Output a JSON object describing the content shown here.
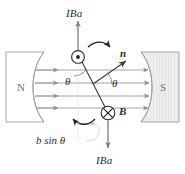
{
  "figure": {
    "colors": {
      "ink": "#2b2b2b",
      "faint_ink": "#6f6f6f",
      "field_line": "#9a9a9a",
      "magnet_outline": "#9c9c9c",
      "magnet_fill_south": "#e8e8e8",
      "magnet_fill_north": "#ffffff",
      "caption_grey": "#d2d2d2"
    },
    "labels": {
      "force_top": "IBa",
      "force_bottom": "IBa",
      "pole_north": "N",
      "pole_south": "S",
      "normal_vector": "n",
      "field_vector": "B",
      "angle_left": "θ",
      "angle_right": "θ",
      "moment_arm": "b sin θ"
    },
    "symbols": {
      "current_out_of_page": "dot-in-circle",
      "current_into_page": "cross-in-circle",
      "rotation_top": "curved-arrow-clockwise",
      "rotation_bottom": "curved-arrow-counterclockwise"
    },
    "caption_partial": ""
  }
}
